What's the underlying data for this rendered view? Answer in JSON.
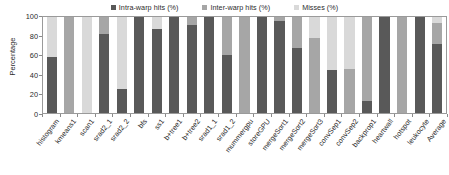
{
  "chart_data": {
    "type": "bar",
    "subtype": "stacked-bar",
    "title": "",
    "xlabel": "",
    "ylabel": "Percentage",
    "ylim": [
      0,
      100
    ],
    "yticks": [
      0,
      20,
      40,
      60,
      80,
      100
    ],
    "grid": false,
    "legend_position": "top-center",
    "colors": {
      "intra_warp_hits": "#595959",
      "inter_warp_hits": "#a6a6a6",
      "misses": "#d9d9d9",
      "axis": "#9a9a9a",
      "text": "#2b2b2b"
    },
    "categories": [
      "histogram",
      "kmeans1",
      "scan1",
      "srad2_1",
      "srad2_2",
      "bfs",
      "ss1",
      "b+tree1",
      "b+tree2",
      "srad1_1",
      "srad1_2",
      "mummergpu",
      "storeGPU",
      "mergeSort1",
      "mergeSort2",
      "mergeSort3",
      "convSep1",
      "convSep2",
      "backprop1",
      "heartwall",
      "hotspot",
      "leukocyte",
      "Average"
    ],
    "series": [
      {
        "name": "Intra-warp hits (%)",
        "color": "#595959",
        "values": [
          58,
          0,
          0,
          82,
          25,
          100,
          88,
          100,
          92,
          100,
          60,
          0,
          100,
          96,
          68,
          0,
          45,
          0,
          12,
          100,
          0,
          100,
          72
        ]
      },
      {
        "name": "Inter-warp hits (%)",
        "color": "#a6a6a6",
        "values": [
          0,
          100,
          0,
          18,
          0,
          0,
          0,
          0,
          8,
          0,
          40,
          100,
          0,
          4,
          32,
          78,
          0,
          46,
          88,
          0,
          100,
          0,
          22
        ]
      },
      {
        "name": "Misses (%)",
        "color": "#d9d9d9",
        "values": [
          42,
          0,
          100,
          0,
          75,
          0,
          12,
          0,
          0,
          0,
          0,
          0,
          0,
          0,
          0,
          22,
          55,
          54,
          0,
          0,
          0,
          0,
          6
        ]
      }
    ]
  },
  "legend": {
    "items": [
      {
        "label": "Intra-warp hits (%)",
        "color": "#595959",
        "key": "intra"
      },
      {
        "label": "Inter-warp hits (%)",
        "color": "#a6a6a6",
        "key": "inter"
      },
      {
        "label": "Misses (%)",
        "color": "#d9d9d9",
        "key": "misses"
      }
    ]
  },
  "axes": {
    "y_title": "Percentage",
    "y_tick_labels": [
      "100",
      "80",
      "60",
      "40",
      "20",
      "0"
    ]
  }
}
